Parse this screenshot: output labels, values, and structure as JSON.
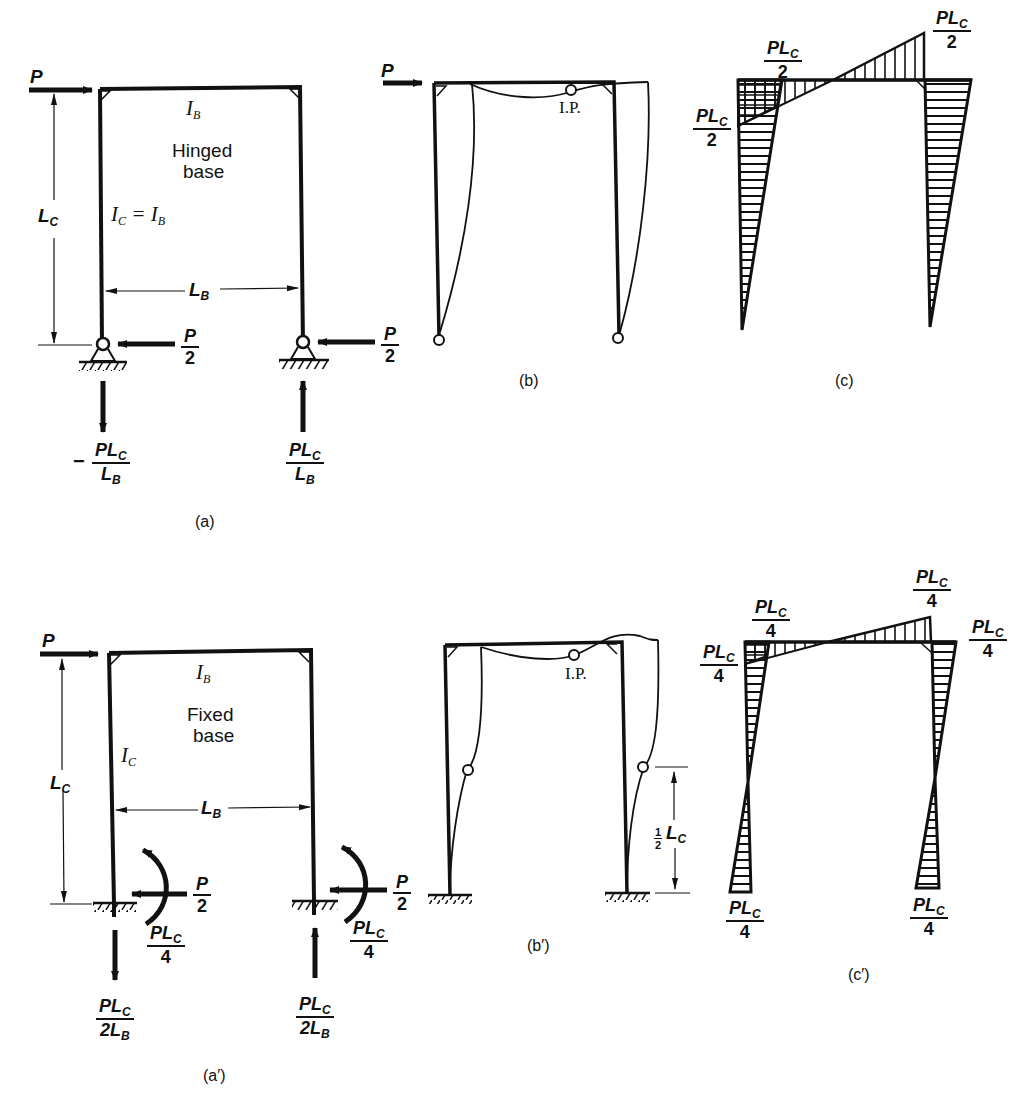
{
  "panels": {
    "a": {
      "caption": "(a)",
      "load": "P",
      "beam_inertia": "I",
      "beam_inertia_sub": "B",
      "base_type_line1": "Hinged",
      "base_type_line2": "base",
      "column_inertia": "I",
      "column_inertia_sub": "C",
      "column_inertia_eq": "= I",
      "column_inertia_eq_sub": "B",
      "height_dim": "L",
      "height_dim_sub": "C",
      "span_dim": "L",
      "span_dim_sub": "B",
      "left_horizontal_reaction": {
        "num": "P",
        "den": "2"
      },
      "right_horizontal_reaction": {
        "num": "P",
        "den": "2"
      },
      "left_vertical_reaction": {
        "sign": "−",
        "num": "PL",
        "num_sub": "C",
        "den": "L",
        "den_sub": "B"
      },
      "right_vertical_reaction": {
        "num": "PL",
        "num_sub": "C",
        "den": "L",
        "den_sub": "B"
      }
    },
    "b": {
      "caption": "(b)",
      "load": "P",
      "inflection_point": "I.P."
    },
    "c": {
      "caption": "(c)",
      "moment_top_left_beam": {
        "num": "PL",
        "num_sub": "C",
        "den": "2"
      },
      "moment_top_left_column": {
        "num": "PL",
        "num_sub": "C",
        "den": "2"
      },
      "moment_top_right": {
        "num": "PL",
        "num_sub": "C",
        "den": "2"
      }
    },
    "a_prime": {
      "caption": "(a′)",
      "load": "P",
      "beam_inertia": "I",
      "beam_inertia_sub": "B",
      "base_type_line1": "Fixed",
      "base_type_line2": "base",
      "column_inertia": "I",
      "column_inertia_sub": "C",
      "height_dim": "L",
      "height_dim_sub": "C",
      "span_dim": "L",
      "span_dim_sub": "B",
      "left_horizontal_reaction": {
        "num": "P",
        "den": "2"
      },
      "right_horizontal_reaction": {
        "num": "P",
        "den": "2"
      },
      "left_moment_reaction": {
        "num": "PL",
        "num_sub": "C",
        "den": "4"
      },
      "right_moment_reaction": {
        "num": "PL",
        "num_sub": "C",
        "den": "4"
      },
      "left_vertical_reaction": {
        "num": "PL",
        "num_sub": "C",
        "den": "2L",
        "den_sub": "B"
      },
      "right_vertical_reaction": {
        "num": "PL",
        "num_sub": "C",
        "den": "2L",
        "den_sub": "B"
      }
    },
    "b_prime": {
      "caption": "(b′)",
      "inflection_point": "I.P.",
      "half_height_dim_num": "1",
      "half_height_dim_den": "2",
      "half_height_dim": "L",
      "half_height_dim_sub": "C"
    },
    "c_prime": {
      "caption": "(c′)",
      "moment_top_left_beam": {
        "num": "PL",
        "num_sub": "C",
        "den": "4"
      },
      "moment_top_left_column": {
        "num": "PL",
        "num_sub": "C",
        "den": "4"
      },
      "moment_top_right_beam": {
        "num": "PL",
        "num_sub": "C",
        "den": "4"
      },
      "moment_top_right_column": {
        "num": "PL",
        "num_sub": "C",
        "den": "4"
      },
      "moment_base_left": {
        "num": "PL",
        "num_sub": "C",
        "den": "4"
      },
      "moment_base_right": {
        "num": "PL",
        "num_sub": "C",
        "den": "4"
      }
    }
  }
}
